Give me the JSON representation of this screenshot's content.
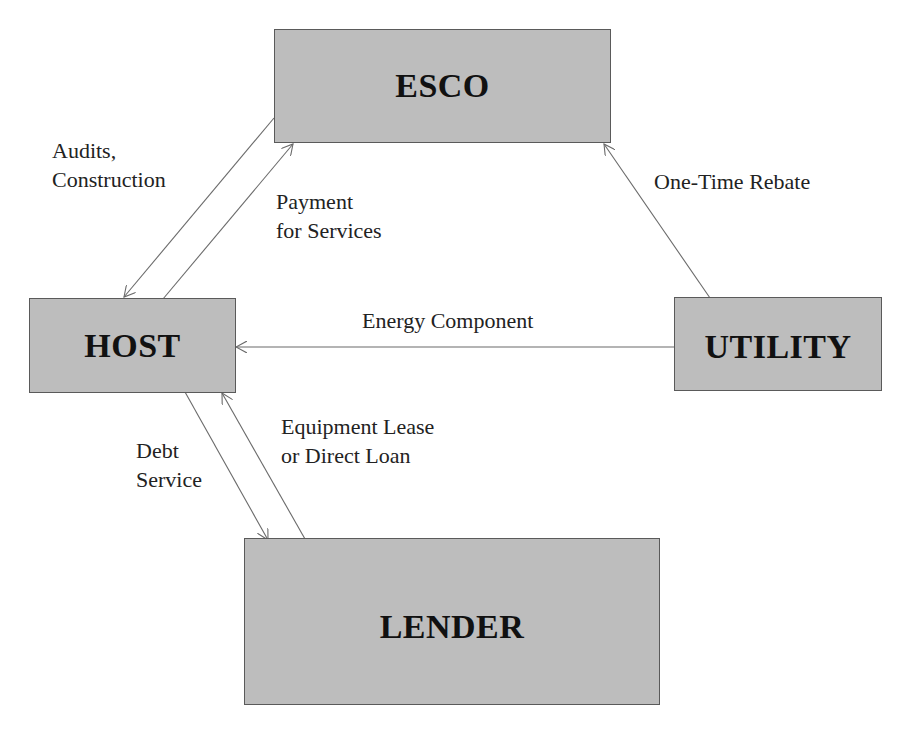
{
  "diagram": {
    "colors": {
      "box_fill": "#bdbdbd",
      "box_border": "#5a5a5a",
      "arrow": "#6a6a6a",
      "text": "#222222"
    },
    "nodes": [
      {
        "id": "esco",
        "label": "ESCO"
      },
      {
        "id": "host",
        "label": "HOST"
      },
      {
        "id": "utility",
        "label": "UTILITY"
      },
      {
        "id": "lender",
        "label": "LENDER"
      }
    ],
    "edges": [
      {
        "from": "ESCO",
        "to": "HOST",
        "label_lines": [
          "Audits,",
          "Construction"
        ]
      },
      {
        "from": "HOST",
        "to": "ESCO",
        "label_lines": [
          "Payment",
          "for Services"
        ]
      },
      {
        "from": "UTILITY",
        "to": "ESCO",
        "label_lines": [
          "One-Time Rebate"
        ]
      },
      {
        "from": "UTILITY",
        "to": "HOST",
        "label_lines": [
          "Energy Component"
        ]
      },
      {
        "from": "HOST",
        "to": "LENDER",
        "label_lines": [
          "Debt",
          "Service"
        ]
      },
      {
        "from": "LENDER",
        "to": "HOST",
        "label_lines": [
          "Equipment Lease",
          "or Direct Loan"
        ]
      }
    ]
  }
}
